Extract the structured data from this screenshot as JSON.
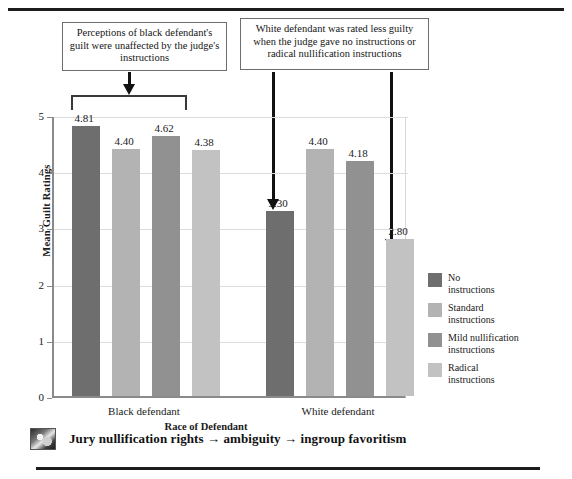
{
  "chart_data": {
    "type": "bar",
    "title": "",
    "xlabel": "Race of Defendant",
    "ylabel": "Mean Guilt Ratings",
    "ylim": [
      0,
      5
    ],
    "yticks": [
      "0",
      "1",
      "2",
      "3",
      "4",
      "5"
    ],
    "grid": true,
    "legend_position": "right",
    "categories": [
      "Black defendant",
      "White defendant"
    ],
    "series": [
      {
        "name": "No instructions",
        "color": "#6e6e6e",
        "values": [
          4.81,
          3.3
        ],
        "labels": [
          "4.81",
          "3.30"
        ]
      },
      {
        "name": "Standard instructions",
        "color": "#b3b3b3",
        "values": [
          4.4,
          4.4
        ],
        "labels": [
          "4.40",
          "4.40"
        ]
      },
      {
        "name": "Mild nullification instructions",
        "color": "#919191",
        "values": [
          4.62,
          4.18
        ],
        "labels": [
          "4.62",
          "4.18"
        ]
      },
      {
        "name": "Radical instructions",
        "color": "#c2c2c2",
        "values": [
          4.38,
          2.8
        ],
        "labels": [
          "4.38",
          "2.80"
        ]
      }
    ],
    "annotations": [
      {
        "id": "left",
        "text": "Perceptions of black defendant's guilt were unaffected by the judge's instructions"
      },
      {
        "id": "right",
        "text": "White defendant was rated less guilty when the judge gave no instructions or radical nullification instructions"
      }
    ]
  },
  "legend": {
    "items": [
      {
        "label_line1": "No",
        "label_line2": "instructions",
        "color": "#6e6e6e"
      },
      {
        "label_line1": "Standard",
        "label_line2": "instructions",
        "color": "#b3b3b3"
      },
      {
        "label_line1": "Mild nullification",
        "label_line2": "instructions",
        "color": "#919191"
      },
      {
        "label_line1": "Radical",
        "label_line2": "instructions",
        "color": "#c2c2c2"
      }
    ]
  },
  "footer": {
    "caption": "Jury nullification rights → ambiguity → ingroup favoritism",
    "thumbnail_name": "photo-thumbnail"
  }
}
